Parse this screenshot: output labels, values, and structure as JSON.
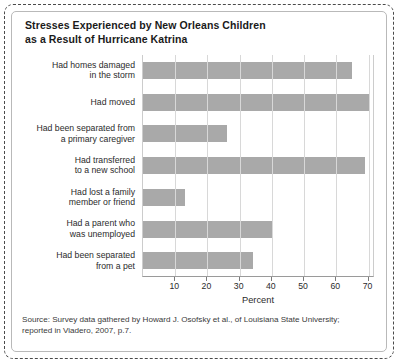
{
  "figure": {
    "title_lines": [
      "Stresses Experienced by New Orleans Children",
      "as a Result of Hurricane Katrina"
    ],
    "source_lines": [
      "Source: Survey data gathered by Howard J. Osofsky et al., of Louisiana State University;",
      "reported in Viadero, 2007, p.7."
    ],
    "bar_color": "#a9a9a9",
    "grid_color": "#d8d8d8",
    "axis_color": "#9a9a9a"
  },
  "chart_data": {
    "type": "bar",
    "orientation": "horizontal",
    "title": "Stresses Experienced by New Orleans Children as a Result of Hurricane Katrina",
    "categories": [
      "Had homes damaged in the storm",
      "Had moved",
      "Had been separated from a primary caregiver",
      "Had transferred to a new school",
      "Had lost a family member or friend",
      "Had a parent who was unemployed",
      "Had been separated from a pet"
    ],
    "category_lines": [
      [
        "Had homes damaged",
        "in the storm"
      ],
      [
        "Had moved"
      ],
      [
        "Had been separated from",
        "a primary caregiver"
      ],
      [
        "Had transferred",
        "to a new school"
      ],
      [
        "Had lost a family",
        "member or friend"
      ],
      [
        "Had a parent who",
        "was unemployed"
      ],
      [
        "Had been separated",
        "from a pet"
      ]
    ],
    "values": [
      65,
      70,
      26,
      69,
      13,
      40,
      34
    ],
    "xlabel": "Percent",
    "ylabel": "",
    "xlim": [
      0,
      72
    ],
    "xticks": [
      10,
      20,
      30,
      40,
      50,
      60,
      70
    ],
    "xtick_labels": [
      "10",
      "20",
      "30",
      "40",
      "50",
      "60",
      "70"
    ],
    "grid": "vertical",
    "legend": "none"
  }
}
